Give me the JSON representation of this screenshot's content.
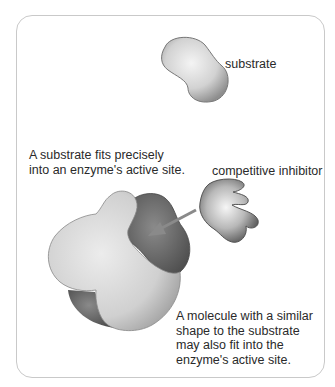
{
  "diagram": {
    "labels": {
      "substrate": "substrate",
      "competitive_inhibitor": "competitive inhibitor",
      "fits_line1": "A substrate fits precisely",
      "fits_line2": "into an enzyme's active site.",
      "molecule_line1": "A molecule with a similar",
      "molecule_line2": "shape to the substrate",
      "molecule_line3": "may also fit into the",
      "molecule_line4": "enzyme's active site."
    },
    "shapes": [
      "substrate-molecule",
      "competitive-inhibitor-molecule",
      "enzyme",
      "active-site",
      "arrow"
    ],
    "colors": {
      "border": "#c9c9c9",
      "enzyme_light": "#d9d9d9",
      "enzyme_dark": "#6e6e6e",
      "arrow": "#8a8a8a",
      "text": "#2a2a2a"
    }
  }
}
